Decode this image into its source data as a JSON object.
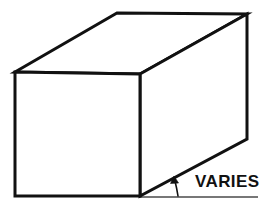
{
  "figure": {
    "background_color": "#ffffff",
    "line_color": "#111111",
    "reference_line_color": "#444444",
    "annotations": {
      "angle_label": "VARIES"
    },
    "geometry": {
      "front_face": {
        "name": "front-face",
        "points": "15,72 140,74 140,196 15,196"
      },
      "top_face": {
        "name": "top-face",
        "points": "15,72 117,13 247,14 140,74"
      },
      "right_face": {
        "name": "right-face",
        "points": "140,74 247,14 247,139 140,196"
      },
      "reference_line": {
        "name": "horizontal-reference-line",
        "x1": 139,
        "y1": 197,
        "x2": 258,
        "y2": 197
      },
      "angle_arrow": {
        "name": "angle-arrow",
        "path": "M 178 196 C 177 189 175.5 183 174.5 179",
        "head": "174,176 170.5,183.5 178.5,183"
      }
    }
  }
}
